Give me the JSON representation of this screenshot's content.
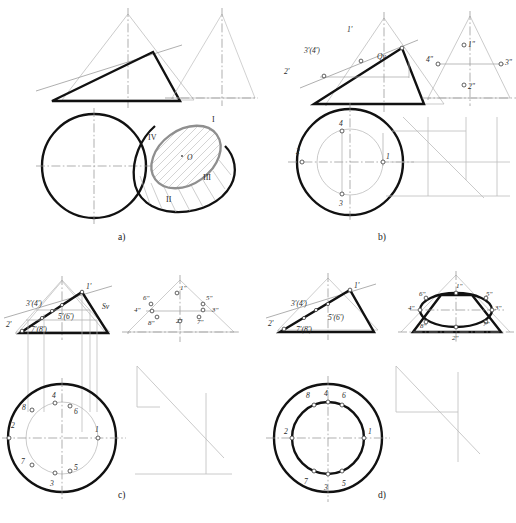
{
  "document": {
    "type": "descriptive-geometry-plate",
    "title": "Construction of the elliptical section of a cone",
    "background_color": "#ffffff",
    "width": 516,
    "height": 523
  },
  "colors": {
    "outline_bold": "#111111",
    "thin_line": "#8d8d8d",
    "center_line": "#8a8a8a",
    "ellipse_gray": "#8f8f8f",
    "hatch": "#b4b4b4",
    "text": "#1f1f1f"
  },
  "panels": [
    {
      "id": "a",
      "caption": "a)",
      "caption_x": 120,
      "caption_y": 236,
      "description": "Pictorial: cone cut by an oblique plane, front view triangle with cutting plane trace and top view circle; 3D cone with hatched elliptical section",
      "views": {
        "front_triangle": {
          "label": "front-view-cut-triangle"
        },
        "top_circle": {
          "label": "top-view-circle"
        },
        "right_triangle": {
          "label": "profile-view-triangle"
        },
        "pictorial": {
          "label": "cone-pictorial-with-section"
        }
      },
      "roman_labels": [
        {
          "text": "I",
          "x": 212,
          "y": 122
        },
        {
          "text": "IV",
          "x": 152,
          "y": 139
        },
        {
          "text": "III",
          "x": 205,
          "y": 179
        },
        {
          "text": "II",
          "x": 168,
          "y": 203
        },
        {
          "text": "O",
          "x": 186,
          "y": 157
        }
      ]
    },
    {
      "id": "b",
      "caption": "b)",
      "caption_x": 378,
      "caption_y": 236,
      "description": "Four key points 1-4 located on the cutting plane trace Qv, projected into top and profile views",
      "plane_trace_label": "Qv",
      "front_labels": [
        {
          "text": "1'",
          "x": 349,
          "y": 30
        },
        {
          "text": "3'(4')",
          "x": 307,
          "y": 51
        },
        {
          "text": "2'",
          "x": 287,
          "y": 72
        },
        {
          "text": "Qv",
          "x": 378,
          "y": 57
        }
      ],
      "top_labels": [
        {
          "text": "4",
          "x": 340,
          "y": 127
        },
        {
          "text": "2",
          "x": 300,
          "y": 148
        },
        {
          "text": "1",
          "x": 365,
          "y": 155
        },
        {
          "text": "3",
          "x": 340,
          "y": 196
        }
      ],
      "profile_labels": [
        {
          "text": "1\"",
          "x": 466,
          "y": 47
        },
        {
          "text": "4\"",
          "x": 430,
          "y": 64
        },
        {
          "text": "3\"",
          "x": 486,
          "y": 64
        },
        {
          "text": "2\"",
          "x": 466,
          "y": 89
        }
      ]
    },
    {
      "id": "c",
      "caption": "c)",
      "caption_x": 120,
      "caption_y": 497,
      "description": "Eight points 1-8 located using the cutting plane trace Sv, with auxiliary circle in the top view",
      "plane_trace_label": "Sv",
      "front_labels": [
        {
          "text": "1'",
          "x": 92,
          "y": 305
        },
        {
          "text": "3'(4')",
          "x": 36,
          "y": 325
        },
        {
          "text": "Sv",
          "x": 109,
          "y": 327
        },
        {
          "text": "5'(6')",
          "x": 69,
          "y": 341
        },
        {
          "text": "2'",
          "x": 14,
          "y": 347
        },
        {
          "text": "7'(8')",
          "x": 41,
          "y": 352
        }
      ],
      "top_labels": [
        {
          "text": "4",
          "x": 55,
          "y": 396
        },
        {
          "text": "8",
          "x": 36,
          "y": 407
        },
        {
          "text": "6",
          "x": 64,
          "y": 412
        },
        {
          "text": "2",
          "x": 22,
          "y": 425
        },
        {
          "text": "1",
          "x": 81,
          "y": 425
        },
        {
          "text": "7",
          "x": 35,
          "y": 454
        },
        {
          "text": "5",
          "x": 63,
          "y": 453
        },
        {
          "text": "3",
          "x": 52,
          "y": 466
        }
      ],
      "profile_labels": [
        {
          "text": "1\"",
          "x": 181,
          "y": 318
        },
        {
          "text": "6\"",
          "x": 145,
          "y": 330
        },
        {
          "text": "5\"",
          "x": 206,
          "y": 330
        },
        {
          "text": "4\"",
          "x": 136,
          "y": 340
        },
        {
          "text": "3\"",
          "x": 212,
          "y": 340
        },
        {
          "text": "8\"",
          "x": 150,
          "y": 352
        },
        {
          "text": "2\"",
          "x": 178,
          "y": 350
        },
        {
          "text": "7\"",
          "x": 198,
          "y": 351
        }
      ]
    },
    {
      "id": "d",
      "caption": "d)",
      "caption_x": 378,
      "caption_y": 497,
      "description": "Finished section: the ellipse drawn through points 1-8 in the profile view, concentric circles in the top view",
      "front_labels": [
        {
          "text": "1'",
          "x": 350,
          "y": 305
        },
        {
          "text": "3'(4')",
          "x": 295,
          "y": 325
        },
        {
          "text": "5'(6')",
          "x": 330,
          "y": 340
        },
        {
          "text": "2'",
          "x": 272,
          "y": 347
        },
        {
          "text": "7'(8')",
          "x": 300,
          "y": 352
        }
      ],
      "top_labels": [
        {
          "text": "8",
          "x": 322,
          "y": 400
        },
        {
          "text": "4",
          "x": 340,
          "y": 398
        },
        {
          "text": "6",
          "x": 357,
          "y": 400
        },
        {
          "text": "2",
          "x": 300,
          "y": 424
        },
        {
          "text": "1",
          "x": 380,
          "y": 424
        },
        {
          "text": "7",
          "x": 322,
          "y": 462
        },
        {
          "text": "3",
          "x": 340,
          "y": 468
        },
        {
          "text": "5",
          "x": 357,
          "y": 464
        }
      ],
      "profile_labels": [
        {
          "text": "1\"",
          "x": 458,
          "y": 314
        },
        {
          "text": "6\"",
          "x": 428,
          "y": 327
        },
        {
          "text": "5\"",
          "x": 487,
          "y": 327
        },
        {
          "text": "4\"",
          "x": 420,
          "y": 340
        },
        {
          "text": "3\"",
          "x": 494,
          "y": 340
        },
        {
          "text": "8\"",
          "x": 434,
          "y": 354
        },
        {
          "text": "7\"",
          "x": 480,
          "y": 352
        },
        {
          "text": "2\"",
          "x": 456,
          "y": 364
        }
      ]
    }
  ]
}
